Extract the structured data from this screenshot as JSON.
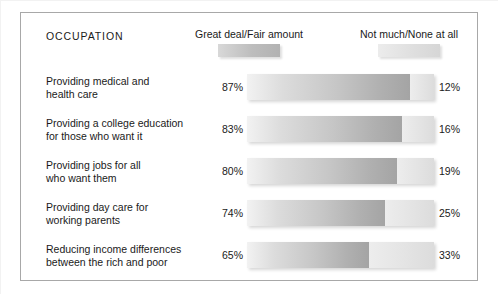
{
  "panel": {
    "occupation_header": "OCCUPATION"
  },
  "legend": {
    "great_label": "Great deal/Fair amount",
    "not_label": "Not much/None at all",
    "great_color": "#bdbdbd",
    "not_color": "#dedede"
  },
  "chart_data": {
    "type": "bar",
    "title": "OCCUPATION",
    "orientation": "horizontal",
    "stacked": true,
    "xlabel": "",
    "ylabel": "",
    "xlim": [
      0,
      100
    ],
    "grid": false,
    "legend_position": "top",
    "categories": [
      "Providing medical and health care",
      "Providing a college education for those who want it",
      "Providing jobs for all who want them",
      "Providing day care for working parents",
      "Reducing income differences between the rich and poor"
    ],
    "series": [
      {
        "name": "Great deal/Fair amount",
        "values": [
          87,
          83,
          80,
          74,
          65
        ]
      },
      {
        "name": "Not much/None at all",
        "values": [
          12,
          16,
          19,
          25,
          33
        ]
      }
    ]
  },
  "rows": [
    {
      "label_line1": "Providing medical and",
      "label_line2": "health care",
      "left_pct": "87%",
      "right_pct": "12%",
      "great_value": 87,
      "not_value": 12
    },
    {
      "label_line1": "Providing a college education",
      "label_line2": "for those who want it",
      "left_pct": "83%",
      "right_pct": "16%",
      "great_value": 83,
      "not_value": 16
    },
    {
      "label_line1": "Providing jobs for all",
      "label_line2": "who want them",
      "left_pct": "80%",
      "right_pct": "19%",
      "great_value": 80,
      "not_value": 19
    },
    {
      "label_line1": "Providing day care for",
      "label_line2": "working parents",
      "left_pct": "74%",
      "right_pct": "25%",
      "great_value": 74,
      "not_value": 25
    },
    {
      "label_line1": "Reducing income differences",
      "label_line2": "between the rich and poor",
      "left_pct": "65%",
      "right_pct": "33%",
      "great_value": 65,
      "not_value": 33
    }
  ]
}
